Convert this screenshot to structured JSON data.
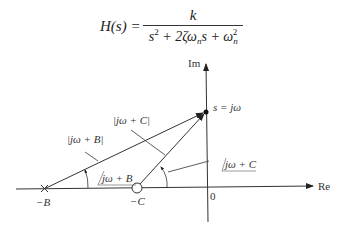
{
  "equation": {
    "lhs": "H(s) =",
    "numerator": "k",
    "denominator_parts": [
      "s",
      "2",
      " + 2ζω",
      "n",
      "s + ω",
      "n",
      "2"
    ]
  },
  "diagram": {
    "axis_labels": {
      "real": "Re",
      "imag": "Im",
      "origin": "0"
    },
    "points": {
      "s": "s = jω",
      "pole": "−B",
      "zero": "−C"
    },
    "vector_labels": {
      "magnitude_B": "|jω + B|",
      "magnitude_C": "|jω + C|",
      "angle_B": "jω + B",
      "angle_C": "jω + C"
    }
  }
}
